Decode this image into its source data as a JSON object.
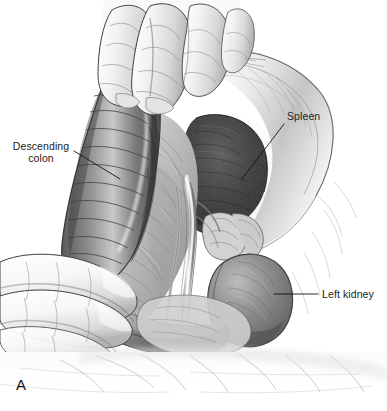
{
  "figure": {
    "panel_letter": "A",
    "domain_note": "grayscale pen-and-ink surgical anatomy illustration",
    "background_color": "#ffffff",
    "ink_color": "#1c1c1c",
    "width": 387,
    "height": 411
  },
  "labels": [
    {
      "id": "descending-colon",
      "text": "Descending\ncolon",
      "x": 8,
      "y": 140,
      "leader": {
        "x1": 74,
        "y1": 151,
        "x2": 120,
        "y2": 179
      }
    },
    {
      "id": "spleen",
      "text": "Spleen",
      "x": 287,
      "y": 110,
      "leader": {
        "x1": 284,
        "y1": 124,
        "x2": 242,
        "y2": 179
      }
    },
    {
      "id": "left-kidney",
      "text": "Left kidney",
      "x": 322,
      "y": 288,
      "leader": {
        "x1": 318,
        "y1": 294,
        "x2": 274,
        "y2": 294
      }
    }
  ],
  "anatomy": [
    {
      "id": "descending-colon",
      "name": "Descending colon",
      "tone": "#6f6f6f"
    },
    {
      "id": "spleen",
      "name": "Spleen",
      "tone": "#3a3a3a"
    },
    {
      "id": "left-kidney",
      "name": "Left kidney",
      "tone": "#7c7c7c"
    },
    {
      "id": "mesentery",
      "name": "Mesentery / retroperitoneal fascia",
      "tone": "#b9b9b9"
    },
    {
      "id": "surgeon-hand-upper",
      "name": "Surgeon hand retracting upper field",
      "tone": "#ededed"
    },
    {
      "id": "surgeon-hand-lower",
      "name": "Surgeon hand retracting lower field",
      "tone": "#f1f1f1"
    },
    {
      "id": "surgical-drape",
      "name": "Surgical drape",
      "tone": "#f4f4f4"
    },
    {
      "id": "abdominal-wall",
      "name": "Retracted abdominal wall",
      "tone": "#dcdcdc"
    }
  ]
}
